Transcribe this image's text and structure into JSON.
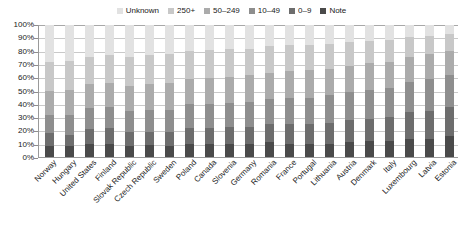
{
  "legend": {
    "position": "top-center",
    "items": [
      {
        "label": "Unknown",
        "color": "#e2e2e2"
      },
      {
        "label": "250+",
        "color": "#c8c8c8"
      },
      {
        "label": "50–249",
        "color": "#ababab"
      },
      {
        "label": "10–49",
        "color": "#8e8e8e"
      },
      {
        "label": "0–9",
        "color": "#6d6d6d"
      },
      {
        "label": "Note",
        "color": "#4a4a4a"
      }
    ]
  },
  "chart_data": {
    "type": "bar",
    "title": "",
    "subtitle": "",
    "xlabel": "",
    "ylabel": "",
    "stacked": true,
    "stack_mode": "percent",
    "ylim": [
      0,
      100
    ],
    "grid": true,
    "legend_position": "top-center",
    "ytick_labels": [
      "0%",
      "10%",
      "20%",
      "30%",
      "40%",
      "50%",
      "60%",
      "70%",
      "80%",
      "90%",
      "100%"
    ],
    "ytick_values": [
      0,
      10,
      20,
      30,
      40,
      50,
      60,
      70,
      80,
      90,
      100
    ],
    "categories": [
      "Norway",
      "Hungary",
      "United States",
      "Finland",
      "Slovak Republic",
      "Czech Republic",
      "Sweden",
      "Poland",
      "Canada",
      "Slovenia",
      "Germany",
      "Romania",
      "France",
      "Portugal",
      "Lithuania",
      "Austria",
      "Denmark",
      "Italy",
      "Luxembourg",
      "Latvia",
      "Estonia"
    ],
    "series": [
      {
        "name": "Note",
        "color": "#4a4a4a",
        "values": [
          8,
          8,
          10,
          10,
          8,
          9,
          8,
          10,
          10,
          10,
          10,
          11,
          10,
          10,
          10,
          11,
          12,
          12,
          14,
          14,
          16
        ]
      },
      {
        "name": "0–9",
        "color": "#6d6d6d",
        "values": [
          10,
          9,
          11,
          12,
          11,
          10,
          11,
          12,
          12,
          13,
          13,
          14,
          15,
          15,
          16,
          17,
          17,
          18,
          20,
          21,
          22
        ]
      },
      {
        "name": "10–49",
        "color": "#8e8e8e",
        "values": [
          14,
          15,
          16,
          16,
          16,
          17,
          17,
          18,
          18,
          18,
          19,
          19,
          20,
          20,
          21,
          21,
          22,
          22,
          23,
          24,
          24
        ]
      },
      {
        "name": "50–249",
        "color": "#ababab",
        "values": [
          18,
          19,
          18,
          18,
          19,
          19,
          20,
          19,
          20,
          20,
          20,
          20,
          20,
          21,
          20,
          20,
          20,
          20,
          19,
          19,
          18
        ]
      },
      {
        "name": "250+",
        "color": "#c8c8c8",
        "values": [
          22,
          22,
          21,
          21,
          22,
          22,
          22,
          21,
          21,
          21,
          20,
          20,
          20,
          19,
          19,
          18,
          17,
          17,
          15,
          14,
          13
        ]
      },
      {
        "name": "Unknown",
        "color": "#e2e2e2",
        "values": [
          28,
          27,
          24,
          23,
          24,
          23,
          22,
          20,
          19,
          18,
          18,
          16,
          15,
          15,
          14,
          13,
          12,
          11,
          9,
          8,
          7
        ]
      }
    ]
  }
}
